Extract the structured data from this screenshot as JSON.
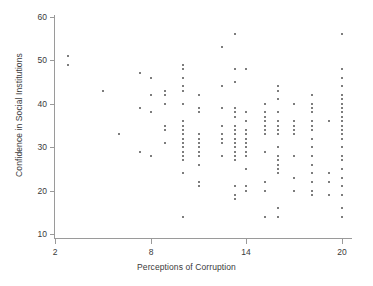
{
  "chart_data": {
    "type": "scatter",
    "title": "",
    "xlabel": "Perceptions of Corruption",
    "ylabel": "Confidence in Social Institutions",
    "xlim": [
      1.2,
      21.2
    ],
    "ylim": [
      8.5,
      61.5
    ],
    "xticks": [
      2,
      8,
      14,
      20
    ],
    "yticks": [
      10,
      20,
      30,
      40,
      50,
      60
    ],
    "xtick_labels": [
      "2",
      "8",
      "14",
      "20"
    ],
    "ytick_labels": [
      "10",
      "20",
      "30",
      "40",
      "50",
      "60"
    ],
    "grid": false,
    "legend": null,
    "marker": {
      "shape": "square",
      "size": 2,
      "color": "#7d7d7d"
    },
    "axis_color": "#9a9a9a",
    "background": "#ffffff",
    "n_points": 193,
    "points": [
      [
        2.8,
        51
      ],
      [
        2.8,
        49
      ],
      [
        5.0,
        43
      ],
      [
        6.0,
        33
      ],
      [
        7.3,
        47
      ],
      [
        7.3,
        39
      ],
      [
        7.3,
        29
      ],
      [
        8.0,
        46
      ],
      [
        8.0,
        42
      ],
      [
        8.0,
        38
      ],
      [
        8.0,
        28
      ],
      [
        8.9,
        43
      ],
      [
        8.9,
        42
      ],
      [
        8.9,
        40
      ],
      [
        8.9,
        35
      ],
      [
        8.9,
        34
      ],
      [
        8.9,
        31
      ],
      [
        10.0,
        49
      ],
      [
        10.0,
        48
      ],
      [
        10.0,
        46
      ],
      [
        10.0,
        44
      ],
      [
        10.0,
        43
      ],
      [
        10.0,
        40
      ],
      [
        10.0,
        36
      ],
      [
        10.0,
        35
      ],
      [
        10.0,
        34
      ],
      [
        10.0,
        33
      ],
      [
        10.0,
        32
      ],
      [
        10.0,
        31
      ],
      [
        10.0,
        30
      ],
      [
        10.0,
        29
      ],
      [
        10.0,
        28
      ],
      [
        10.0,
        27
      ],
      [
        10.0,
        24
      ],
      [
        10.0,
        14
      ],
      [
        11.0,
        42
      ],
      [
        11.0,
        39
      ],
      [
        11.0,
        38
      ],
      [
        11.0,
        33
      ],
      [
        11.0,
        32
      ],
      [
        11.0,
        31
      ],
      [
        11.0,
        30
      ],
      [
        11.0,
        29
      ],
      [
        11.0,
        28
      ],
      [
        11.0,
        26
      ],
      [
        11.0,
        22
      ],
      [
        11.0,
        21
      ],
      [
        12.5,
        53
      ],
      [
        12.5,
        44
      ],
      [
        12.5,
        39
      ],
      [
        12.5,
        35
      ],
      [
        12.5,
        33
      ],
      [
        12.5,
        32
      ],
      [
        12.5,
        31
      ],
      [
        12.5,
        28
      ],
      [
        13.3,
        56
      ],
      [
        13.3,
        48
      ],
      [
        13.3,
        45
      ],
      [
        13.3,
        39
      ],
      [
        13.3,
        38
      ],
      [
        13.3,
        37
      ],
      [
        13.3,
        35
      ],
      [
        13.3,
        34
      ],
      [
        13.3,
        33
      ],
      [
        13.3,
        32
      ],
      [
        13.3,
        31
      ],
      [
        13.3,
        30
      ],
      [
        13.3,
        29
      ],
      [
        13.3,
        28
      ],
      [
        13.3,
        27
      ],
      [
        13.3,
        21
      ],
      [
        13.3,
        19
      ],
      [
        13.3,
        18
      ],
      [
        14.0,
        48
      ],
      [
        14.0,
        38
      ],
      [
        14.0,
        36
      ],
      [
        14.0,
        34
      ],
      [
        14.0,
        33
      ],
      [
        14.0,
        32
      ],
      [
        14.0,
        31
      ],
      [
        14.0,
        30
      ],
      [
        14.0,
        29
      ],
      [
        14.0,
        28
      ],
      [
        14.0,
        25
      ],
      [
        14.0,
        21
      ],
      [
        14.0,
        20
      ],
      [
        15.2,
        40
      ],
      [
        15.2,
        38
      ],
      [
        15.2,
        37
      ],
      [
        15.2,
        36
      ],
      [
        15.2,
        35
      ],
      [
        15.2,
        34
      ],
      [
        15.2,
        33
      ],
      [
        15.2,
        29
      ],
      [
        15.2,
        22
      ],
      [
        15.2,
        20
      ],
      [
        15.2,
        14
      ],
      [
        16.0,
        44
      ],
      [
        16.0,
        43
      ],
      [
        16.0,
        41
      ],
      [
        16.0,
        38
      ],
      [
        16.0,
        36
      ],
      [
        16.0,
        35
      ],
      [
        16.0,
        34
      ],
      [
        16.0,
        33
      ],
      [
        16.0,
        30
      ],
      [
        16.0,
        28
      ],
      [
        16.0,
        27
      ],
      [
        16.0,
        26
      ],
      [
        16.0,
        25
      ],
      [
        16.0,
        24
      ],
      [
        16.0,
        16
      ],
      [
        16.0,
        14
      ],
      [
        17.0,
        40
      ],
      [
        17.0,
        36
      ],
      [
        17.0,
        35
      ],
      [
        17.0,
        34
      ],
      [
        17.0,
        33
      ],
      [
        17.0,
        28
      ],
      [
        17.0,
        23
      ],
      [
        17.0,
        20
      ],
      [
        18.1,
        42
      ],
      [
        18.1,
        40
      ],
      [
        18.1,
        39
      ],
      [
        18.1,
        38
      ],
      [
        18.1,
        36
      ],
      [
        18.1,
        35
      ],
      [
        18.1,
        34
      ],
      [
        18.1,
        32
      ],
      [
        18.1,
        30
      ],
      [
        18.1,
        28
      ],
      [
        18.1,
        26
      ],
      [
        18.1,
        24
      ],
      [
        18.1,
        22
      ],
      [
        18.1,
        20
      ],
      [
        18.1,
        19
      ],
      [
        19.2,
        36
      ],
      [
        19.2,
        24
      ],
      [
        19.2,
        22
      ],
      [
        19.2,
        19
      ],
      [
        20.0,
        56
      ],
      [
        20.0,
        48
      ],
      [
        20.0,
        46
      ],
      [
        20.0,
        44
      ],
      [
        20.0,
        42
      ],
      [
        20.0,
        41
      ],
      [
        20.0,
        40
      ],
      [
        20.0,
        39
      ],
      [
        20.0,
        38
      ],
      [
        20.0,
        37
      ],
      [
        20.0,
        36
      ],
      [
        20.0,
        35
      ],
      [
        20.0,
        34
      ],
      [
        20.0,
        33
      ],
      [
        20.0,
        32
      ],
      [
        20.0,
        30
      ],
      [
        20.0,
        28
      ],
      [
        20.0,
        27
      ],
      [
        20.0,
        25
      ],
      [
        20.0,
        23
      ],
      [
        20.0,
        21
      ],
      [
        20.0,
        19
      ],
      [
        20.0,
        16
      ],
      [
        20.0,
        14
      ]
    ]
  }
}
